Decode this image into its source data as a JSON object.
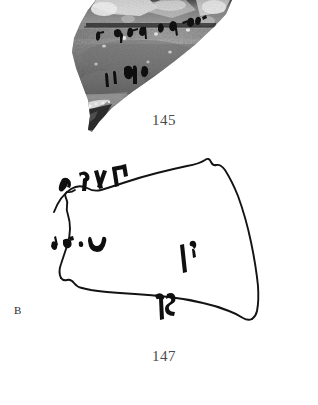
{
  "plate": {
    "title": "Ostraca plate",
    "background_color": "#ffffff",
    "ink_color": "#1a1a1a",
    "caption_color": "#4a4a4a"
  },
  "figures": [
    {
      "number": "145",
      "kind": "photograph",
      "subject": "inscribed pottery sherd (ostracon)",
      "caption": "145",
      "description": "Grayscale photograph of a triangular potsherd with two lines of dark ink characters",
      "text_lines": 2,
      "tone_range": {
        "lightest": "#f2f2f2",
        "mid": "#8d8d8d",
        "darkest": "#161616"
      }
    },
    {
      "number": "147",
      "kind": "line-drawing",
      "subject": "ostracon facsimile",
      "caption": "147",
      "side_label": "B",
      "description": "Ink facsimile outline of a trapezoidal sherd with four clusters of Aramaic characters",
      "inscription_groups": [
        {
          "id": "line-1-top-left",
          "glyph_count": 4
        },
        {
          "id": "line-2-left",
          "glyph_count": 4
        },
        {
          "id": "mark-right-upper",
          "glyph_count": 2
        },
        {
          "id": "mark-center-lower",
          "glyph_count": 2
        }
      ]
    }
  ]
}
